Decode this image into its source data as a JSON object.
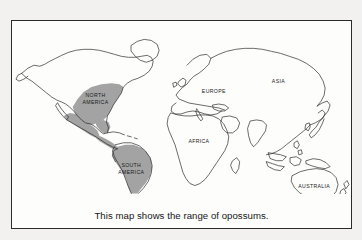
{
  "figure": {
    "caption": "This map shows the range of opossums.",
    "frame_color": "#2b2b2b",
    "background_color": "#f2f1ef",
    "paper_color": "#fdfdfc"
  },
  "map": {
    "title": "World map showing opossum range",
    "outline_color": "#2b2b2b",
    "range_fill_color": "#a3a3a3",
    "labels": [
      {
        "id": "north-america",
        "text": "NORTH\nAMERICA",
        "line1": "NORTH",
        "line2": "AMERICA",
        "x": 84,
        "y": 78,
        "shaded": true
      },
      {
        "id": "south-america",
        "text": "SOUTH\nAMERICA",
        "line1": "SOUTH",
        "line2": "AMERICA",
        "x": 108,
        "y": 148,
        "shaded": true
      },
      {
        "id": "europe",
        "text": "EUROPE",
        "line1": "EUROPE",
        "line2": "",
        "x": 203,
        "y": 78,
        "shaded": false
      },
      {
        "id": "asia",
        "text": "ASIA",
        "line1": "ASIA",
        "line2": "",
        "x": 268,
        "y": 70,
        "shaded": false
      },
      {
        "id": "africa",
        "text": "AFRICA",
        "line1": "AFRICA",
        "line2": "",
        "x": 188,
        "y": 122,
        "shaded": false
      },
      {
        "id": "australia",
        "text": "AUSTRALIA",
        "line1": "AUSTRALIA",
        "line2": "",
        "x": 304,
        "y": 168,
        "shaded": false
      }
    ],
    "shaded_regions": [
      "eastern and central North America",
      "Mexico and Central America",
      "South America"
    ]
  }
}
